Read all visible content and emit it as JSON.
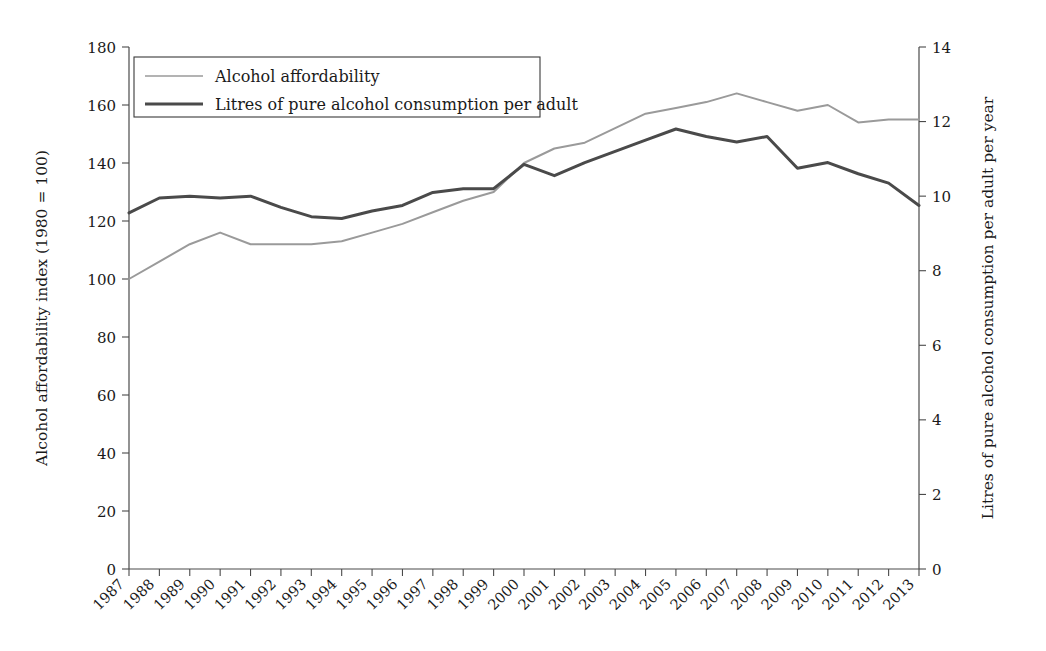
{
  "chart_data": {
    "type": "line",
    "title": "",
    "xlabel": "",
    "ylabel": "Alcohol affordability index (1980 = 100)",
    "y2label": "Litres of pure alcohol consumption per adult per year",
    "grid": false,
    "legend_position": "top-left",
    "categories": [
      "1987",
      "1988",
      "1989",
      "1990",
      "1991",
      "1992",
      "1993",
      "1994",
      "1995",
      "1996",
      "1997",
      "1998",
      "1999",
      "2000",
      "2001",
      "2002",
      "2003",
      "2004",
      "2005",
      "2006",
      "2007",
      "2008",
      "2009",
      "2010",
      "2011",
      "2012",
      "2013"
    ],
    "x": [
      1987,
      1988,
      1989,
      1990,
      1991,
      1992,
      1993,
      1994,
      1995,
      1996,
      1997,
      1998,
      1999,
      2000,
      2001,
      2002,
      2003,
      2004,
      2005,
      2006,
      2007,
      2008,
      2009,
      2010,
      2011,
      2012,
      2013
    ],
    "ylim": [
      0,
      180
    ],
    "yticks": [
      0,
      20,
      40,
      60,
      80,
      100,
      120,
      140,
      160,
      180
    ],
    "y2lim": [
      0,
      14
    ],
    "y2ticks": [
      0,
      2,
      4,
      6,
      8,
      10,
      12,
      14
    ],
    "series": [
      {
        "name": "Alcohol affordability",
        "axis": "left",
        "color": "#9a9a9a",
        "width": 2.0,
        "values": [
          100,
          106,
          112,
          116,
          112,
          112,
          112,
          113,
          116,
          119,
          123,
          127,
          130,
          140,
          145,
          147,
          152,
          157,
          159,
          161,
          164,
          161,
          158,
          160,
          154,
          155,
          155
        ]
      },
      {
        "name": "Litres of pure alcohol consumption per adult",
        "axis": "right",
        "color": "#4a4a4a",
        "width": 3.0,
        "values": [
          9.55,
          9.95,
          10.0,
          9.95,
          10.0,
          9.7,
          9.45,
          9.4,
          9.6,
          9.75,
          10.1,
          10.2,
          10.2,
          10.85,
          10.55,
          10.9,
          11.2,
          11.5,
          11.8,
          11.6,
          11.45,
          11.6,
          10.75,
          10.9,
          10.6,
          10.35,
          9.75
        ]
      }
    ],
    "legend": [
      {
        "label": "Alcohol affordability",
        "color": "#9a9a9a",
        "width": 1.6
      },
      {
        "label": "Litres of pure alcohol consumption per adult",
        "color": "#4a4a4a",
        "width": 3.0
      }
    ]
  }
}
